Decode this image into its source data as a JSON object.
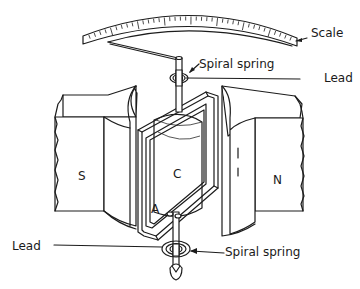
{
  "diagram": {
    "labels": {
      "scale": "Scale",
      "spiral_spring_top": "Spiral spring",
      "lead_top": "Lead",
      "lead_bottom": "Lead",
      "spiral_spring_bottom": "Spiral spring",
      "south_pole": "S",
      "north_pole": "N",
      "core": "C",
      "armature": "A"
    },
    "colors": {
      "ink": "#1c1c1c",
      "background": "#ffffff"
    }
  }
}
